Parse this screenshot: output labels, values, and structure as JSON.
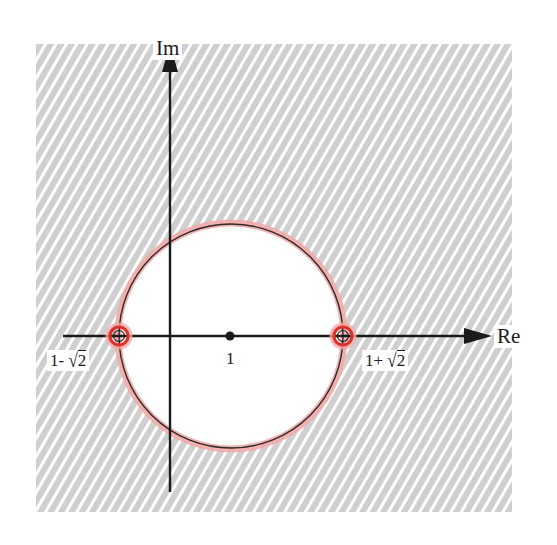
{
  "diagram": {
    "type": "complex-plane-region",
    "axes": {
      "real_label": "Re",
      "imag_label": "Im"
    },
    "circle": {
      "center_label": "1",
      "center": 1,
      "radius_expr": "√2"
    },
    "points": [
      {
        "label_prefix": "1- ",
        "label_radical": "√",
        "label_arg": "2",
        "value": "1-√2"
      },
      {
        "label_prefix": "1+ ",
        "label_radical": "√",
        "label_arg": "2",
        "value": "1+√2"
      }
    ],
    "colors": {
      "hatch_stripe": "#c8c8c8",
      "hatch_gap": "#ffffff",
      "circle_stroke": "#2a2a2a",
      "circle_halo": "#f2a8a6",
      "point_ring": "#d9342b",
      "axis": "#1a1a1a"
    },
    "shaded_region": "exterior of circle |z-1| = √2 (hatched)"
  }
}
